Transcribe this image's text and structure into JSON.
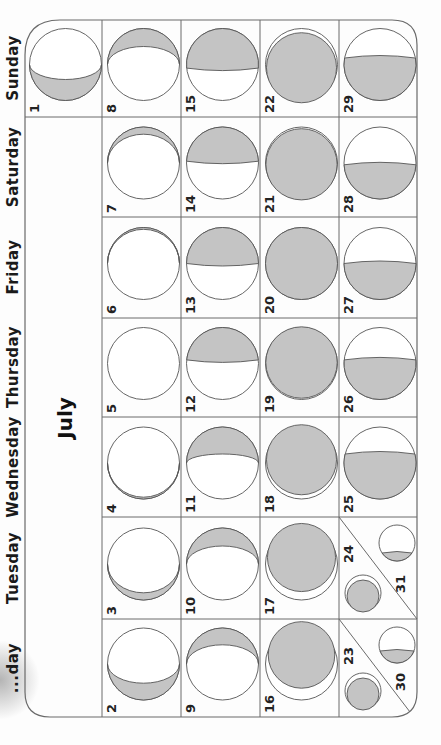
{
  "calendar": {
    "month": "July",
    "orientation": "rotated-90-clockwise",
    "weekdays": [
      "Sunday",
      "Saturday",
      "Friday",
      "Thursday",
      "Wednesday",
      "Tuesday",
      "Monday"
    ],
    "weekday_visible_labels": [
      "Sunday",
      "Saturday",
      "Friday",
      "Thursday",
      "Wednesday",
      "Tuesday",
      "...day"
    ],
    "colors": {
      "shade": "#c4c4c4",
      "line": "#6a6a6a",
      "text": "#1a1a1a"
    },
    "days": [
      {
        "day": "1",
        "weekday": "Sunday",
        "phase": "waning-crescent-thin-bottom"
      },
      {
        "day": "2",
        "weekday": "Monday",
        "phase": "thin-crescent-bottom"
      },
      {
        "day": "3",
        "weekday": "Tuesday",
        "phase": "very-thin-crescent-bottom"
      },
      {
        "day": "4",
        "weekday": "Wednesday",
        "phase": "sliver-bottom"
      },
      {
        "day": "5",
        "weekday": "Thursday",
        "phase": "new"
      },
      {
        "day": "6",
        "weekday": "Friday",
        "phase": "sliver-top"
      },
      {
        "day": "7",
        "weekday": "Saturday",
        "phase": "thin-crescent-top"
      },
      {
        "day": "8",
        "weekday": "Sunday",
        "phase": "crescent-top"
      },
      {
        "day": "9",
        "weekday": "Monday",
        "phase": "crescent-top"
      },
      {
        "day": "10",
        "weekday": "Tuesday",
        "phase": "crescent-top"
      },
      {
        "day": "11",
        "weekday": "Wednesday",
        "phase": "crescent-top-wide"
      },
      {
        "day": "12",
        "weekday": "Thursday",
        "phase": "waxing-near-half"
      },
      {
        "day": "13",
        "weekday": "Friday",
        "phase": "first-quarter"
      },
      {
        "day": "14",
        "weekday": "Saturday",
        "phase": "waxing-gibbous-start"
      },
      {
        "day": "15",
        "weekday": "Sunday",
        "phase": "waxing-gibbous"
      },
      {
        "day": "16",
        "weekday": "Monday",
        "phase": "waxing-gibbous"
      },
      {
        "day": "17",
        "weekday": "Tuesday",
        "phase": "waxing-gibbous-large"
      },
      {
        "day": "18",
        "weekday": "Wednesday",
        "phase": "nearly-full"
      },
      {
        "day": "19",
        "weekday": "Thursday",
        "phase": "nearly-full"
      },
      {
        "day": "20",
        "weekday": "Friday",
        "phase": "full"
      },
      {
        "day": "21",
        "weekday": "Saturday",
        "phase": "nearly-full-waning"
      },
      {
        "day": "22",
        "weekday": "Sunday",
        "phase": "waning-gibbous-large"
      },
      {
        "day": "23",
        "weekday": "Monday",
        "phase": "waning-gibbous",
        "shared_cell_with": "30"
      },
      {
        "day": "24",
        "weekday": "Tuesday",
        "phase": "waning-gibbous",
        "shared_cell_with": "31"
      },
      {
        "day": "25",
        "weekday": "Wednesday",
        "phase": "waning-gibbous-half"
      },
      {
        "day": "26",
        "weekday": "Thursday",
        "phase": "waning-near-half"
      },
      {
        "day": "27",
        "weekday": "Friday",
        "phase": "last-quarter"
      },
      {
        "day": "28",
        "weekday": "Saturday",
        "phase": "waning-crescent"
      },
      {
        "day": "29",
        "weekday": "Sunday",
        "phase": "waning-crescent"
      },
      {
        "day": "30",
        "weekday": "Monday",
        "phase": "waning-crescent-small",
        "shared_cell_with": "23"
      },
      {
        "day": "31",
        "weekday": "Tuesday",
        "phase": "waning-crescent-thin",
        "shared_cell_with": "24"
      }
    ]
  }
}
